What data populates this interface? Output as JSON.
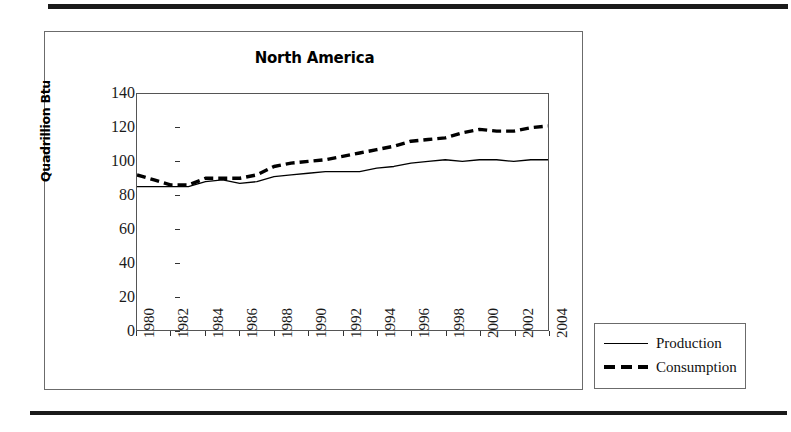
{
  "figure": {
    "title": "North America",
    "rule_color": "#1a1a1a"
  },
  "legend": {
    "items": [
      {
        "label": "Production",
        "style": "solid"
      },
      {
        "label": "Consumption",
        "style": "dashed"
      }
    ]
  },
  "chart_data": {
    "type": "line",
    "title": "North America",
    "xlabel": "",
    "ylabel": "Quadrillion Btu",
    "xlim": [
      1980,
      2004
    ],
    "ylim": [
      0,
      140
    ],
    "ytick_values": [
      0,
      20,
      40,
      60,
      80,
      100,
      120,
      140
    ],
    "ytick_labels": [
      "0",
      "20",
      "40",
      "60",
      "80",
      "100",
      "120",
      "140"
    ],
    "xtick_values": [
      1980,
      1982,
      1984,
      1986,
      1988,
      1990,
      1992,
      1994,
      1996,
      1998,
      2000,
      2002,
      2004
    ],
    "xtick_labels": [
      "1980",
      "1982",
      "1984",
      "1986",
      "1988",
      "1990",
      "1992",
      "1994",
      "1996",
      "1998",
      "2000",
      "2002",
      "2004"
    ],
    "xtick_rotation": 90,
    "grid": false,
    "legend_position": "outside-right-bottom",
    "x": [
      1980,
      1981,
      1982,
      1983,
      1984,
      1985,
      1986,
      1987,
      1988,
      1989,
      1990,
      1991,
      1992,
      1993,
      1994,
      1995,
      1996,
      1997,
      1998,
      1999,
      2000,
      2001,
      2002,
      2003,
      2004
    ],
    "series": [
      {
        "name": "Production",
        "style": "solid",
        "color": "#000000",
        "values": [
          85,
          85,
          85,
          85,
          88,
          89,
          87,
          88,
          91,
          92,
          93,
          94,
          94,
          94,
          96,
          97,
          99,
          100,
          101,
          100,
          101,
          101,
          100,
          101,
          101
        ]
      },
      {
        "name": "Consumption",
        "style": "dashed",
        "color": "#000000",
        "values": [
          92,
          89,
          86,
          86,
          90,
          90,
          90,
          92,
          97,
          99,
          100,
          101,
          103,
          105,
          107,
          109,
          112,
          113,
          114,
          117,
          119,
          118,
          118,
          120,
          121
        ]
      }
    ]
  }
}
